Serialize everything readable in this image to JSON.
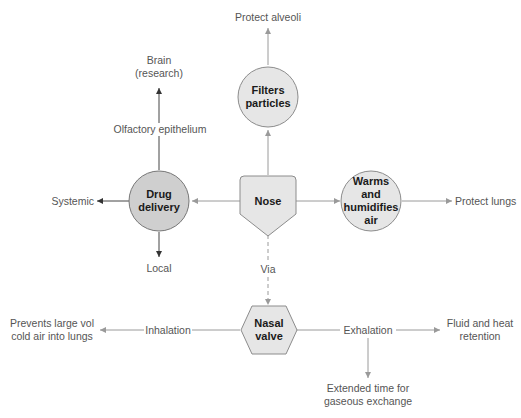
{
  "diagram": {
    "center_node": {
      "label": "Nose",
      "shape": "pentagon"
    },
    "nodes": {
      "filters": {
        "label": "Filters particles",
        "line1": "Filters",
        "line2": "particles",
        "shape": "circle"
      },
      "warms": {
        "label": "Warms and humidifies air",
        "line1": "Warms",
        "line2": "and",
        "line3": "humidifies",
        "line4": "air",
        "shape": "circle"
      },
      "drug": {
        "label": "Drug delivery",
        "line1": "Drug",
        "line2": "delivery",
        "shape": "circle",
        "highlight": true
      },
      "valve": {
        "label": "Nasal valve",
        "line1": "Nasal",
        "line2": "valve",
        "shape": "hexagon"
      }
    },
    "labels": {
      "protect_alveoli": "Protect alveoli",
      "brain": "Brain",
      "brain_sub": "(research)",
      "olfactory": "Olfactory epithelium",
      "systemic": "Systemic",
      "local": "Local",
      "protect_lungs": "Protect lungs",
      "via": "Via",
      "inhalation": "Inhalation",
      "prevents_1": "Prevents large vol",
      "prevents_2": "cold air into lungs",
      "exhalation": "Exhalation",
      "fluid_1": "Fluid and heat",
      "fluid_2": "retention",
      "extended_1": "Extended time for",
      "extended_2": "gaseous exchange"
    },
    "colors": {
      "node_fill": "#e6e6e6",
      "drug_fill": "#cfcfcf",
      "node_stroke": "#8c8c8c",
      "line": "#9a9a9a",
      "dark_line": "#444444",
      "text": "#555555"
    }
  }
}
